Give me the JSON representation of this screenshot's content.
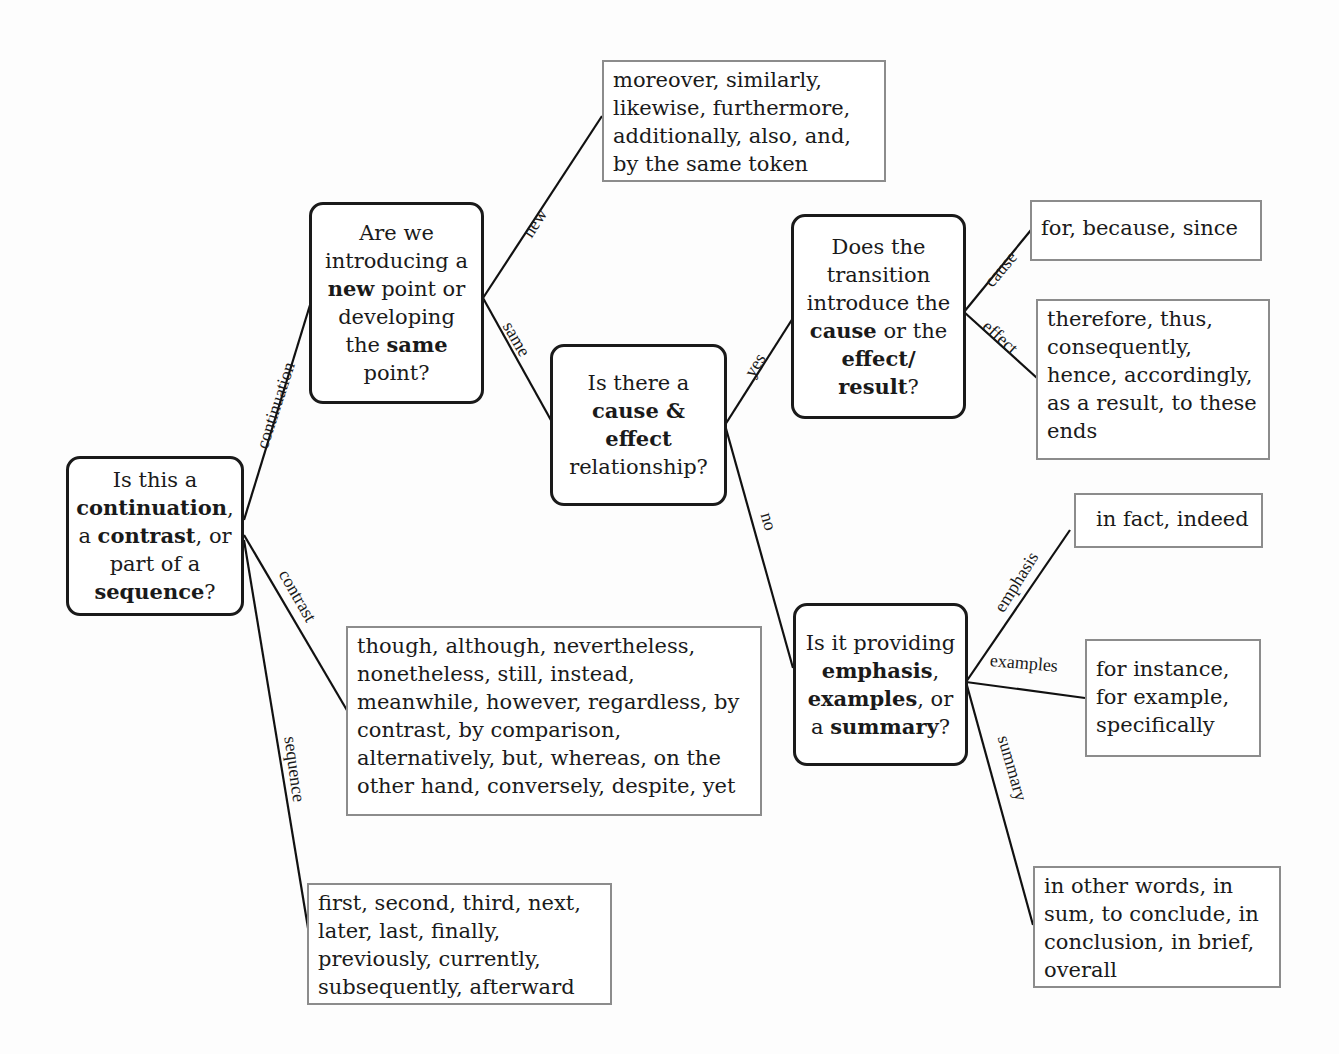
{
  "diagram": {
    "type": "decision-tree",
    "questions": {
      "root": {
        "parts": [
          "Is this a ",
          "continuation",
          ", a ",
          "contrast",
          ", or part of a ",
          "sequence",
          "?"
        ]
      },
      "new_or_same": {
        "parts": [
          "Are we introducing a ",
          "new",
          " point or developing the ",
          "same",
          " point?"
        ]
      },
      "cause_effect": {
        "parts": [
          "Is there a ",
          "cause & effect",
          " relationship?"
        ]
      },
      "cause_or_result": {
        "parts": [
          "Does the transition introduce the ",
          "cause",
          " or the ",
          "effect/ result",
          "?"
        ]
      },
      "emphasis_examples_summary": {
        "parts": [
          "Is it providing ",
          "emphasis",
          ", ",
          "examples",
          ", or a ",
          "summary",
          "?"
        ]
      }
    },
    "answers": {
      "new": "moreover, similarly, likewise, furthermore, additionally, also, and, by the same token",
      "cause": "for, because, since",
      "effect": "therefore, thus, consequently, hence, accordingly, as a result, to these ends",
      "emphasis": "in fact, indeed",
      "examples": "for instance, for example, specifically",
      "summary": "in other words, in sum, to conclude, in conclusion, in brief, overall",
      "contrast": "though, although, nevertheless, nonetheless, still, instead, meanwhile, however, regardless, by contrast, by comparison, alternatively, but, whereas, on the other hand, conversely, despite, yet",
      "sequence": "first, second, third, next, later, last, finally, previously, currently, subsequently, afterward"
    },
    "edge_labels": {
      "continuation": "continuation",
      "contrast": "contrast",
      "sequence": "sequence",
      "new": "new",
      "same": "same",
      "yes": "yes",
      "no": "no",
      "cause": "cause",
      "effect": "effect",
      "emphasis": "emphasis",
      "examples": "examples",
      "summary": "summary"
    }
  }
}
